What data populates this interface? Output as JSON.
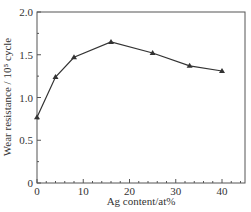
{
  "chart_data": {
    "type": "line",
    "title": "",
    "xlabel": "Ag content/at%",
    "ylabel": "Wear resistance / 10⁵ cycle",
    "x": [
      0,
      4,
      8,
      16,
      25,
      33,
      40
    ],
    "series": [
      {
        "name": "Wear resistance",
        "marker": "triangle",
        "color": "#333333",
        "values": [
          0.77,
          1.24,
          1.47,
          1.65,
          1.52,
          1.37,
          1.31
        ]
      }
    ],
    "xlim": [
      0,
      45
    ],
    "ylim": [
      0,
      2.0
    ],
    "xticks": [
      0,
      10,
      20,
      30,
      40
    ],
    "xtick_labels": [
      "0",
      "10",
      "20",
      "30",
      "40"
    ],
    "yticks": [
      0,
      0.5,
      1.0,
      1.5,
      2.0
    ],
    "ytick_labels": [
      "0",
      "0.5",
      "1.0",
      "1.5",
      "2.0"
    ],
    "grid": false,
    "legend": null
  }
}
